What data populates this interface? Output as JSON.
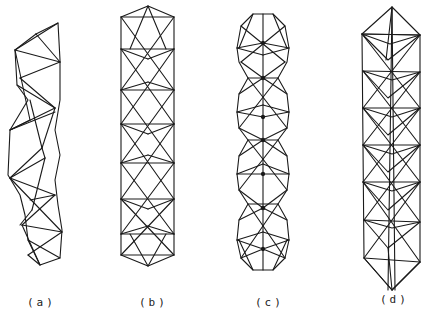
{
  "figure": {
    "panels": [
      {
        "id": "a",
        "label": "(a)",
        "description": "twisted tetrahedral helix truss"
      },
      {
        "id": "b",
        "label": "(b)",
        "description": "stacked square-antiprism column with pyramid caps"
      },
      {
        "id": "c",
        "label": "(c)",
        "description": "chain of four icosahedral/spherical truss units"
      },
      {
        "id": "d",
        "label": "(d)",
        "description": "octahedral column truss with pointed ends"
      }
    ],
    "line_color": "#1a1a1a",
    "background": "#ffffff"
  }
}
